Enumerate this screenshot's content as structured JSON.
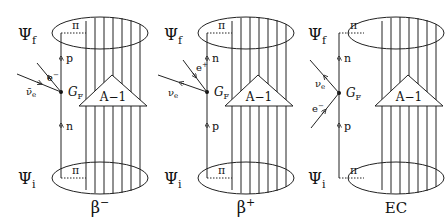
{
  "panels": [
    {
      "id": "beta-minus",
      "label": "β⁻",
      "label_main": "β",
      "label_sup": "−",
      "offset_x": 0,
      "final_state": "Ψ",
      "final_sub": "f",
      "initial_state": "Ψ",
      "initial_sub": "i",
      "pion_top": "π",
      "pion_bottom": "π",
      "core": "A−1",
      "coupling": "G",
      "coupling_sub": "F",
      "nucleon_upper": "p",
      "nucleon_lower": "n",
      "lepton_a": "e",
      "lepton_a_sup": "−",
      "lepton_b": "ν̄",
      "lepton_b_sub": "e"
    },
    {
      "id": "beta-plus",
      "label": "β⁺",
      "label_main": "β",
      "label_sup": "+",
      "offset_x": 146,
      "final_state": "Ψ",
      "final_sub": "f",
      "initial_state": "Ψ",
      "initial_sub": "i",
      "pion_top": "π",
      "pion_bottom": "π",
      "core": "A−1",
      "coupling": "G",
      "coupling_sub": "F",
      "nucleon_upper": "n",
      "nucleon_lower": "p",
      "lepton_a": "e",
      "lepton_a_sup": "+",
      "lepton_b": "ν",
      "lepton_b_sub": "e"
    },
    {
      "id": "electron-capture",
      "label": "EC",
      "label_main": "EC",
      "label_sup": "",
      "offset_x": 292,
      "final_state": "Ψ",
      "final_sub": "f",
      "initial_state": "Ψ",
      "initial_sub": "i",
      "pion_top": "π",
      "pion_bottom": "π",
      "core": "A−1",
      "coupling": "G",
      "coupling_sub": "F",
      "nucleon_upper": "n",
      "nucleon_lower": "p",
      "lepton_a": "ν",
      "lepton_a_sub": "e",
      "lepton_b": "e",
      "lepton_b_sup": "−"
    }
  ]
}
